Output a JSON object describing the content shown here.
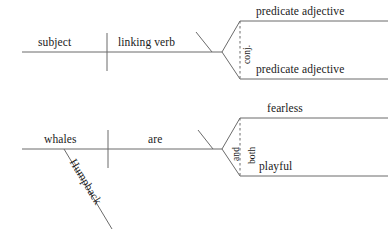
{
  "document": {
    "type": "sentence-diagram",
    "title": "Linking verb with compound predicate adjectives",
    "ink_color": "#6b6b6b",
    "text_color": "#1a1a1a",
    "background": "#ffffff"
  },
  "diagrams": [
    {
      "id": "template-diagram",
      "role": "generic-pattern",
      "subject": "subject",
      "verb": "linking verb",
      "conjunction": "conj.",
      "complements": [
        "predicate adjective",
        "predicate adjective"
      ],
      "modifiers": []
    },
    {
      "id": "example-diagram",
      "role": "worked-example",
      "subject": "whales",
      "verb": "are",
      "conjunction": "and",
      "correlative": "both",
      "complements": [
        "fearless",
        "playful"
      ],
      "modifiers": [
        "Humpback"
      ]
    }
  ],
  "labels": {
    "subject": "subject",
    "linking_verb": "linking verb",
    "conj": "conj.",
    "pred_adj_1": "predicate adjective",
    "pred_adj_2": "predicate adjective",
    "whales": "whales",
    "are": "are",
    "humpback": "Humpback",
    "and": "and",
    "both": "both",
    "fearless": "fearless",
    "playful": "playful"
  }
}
